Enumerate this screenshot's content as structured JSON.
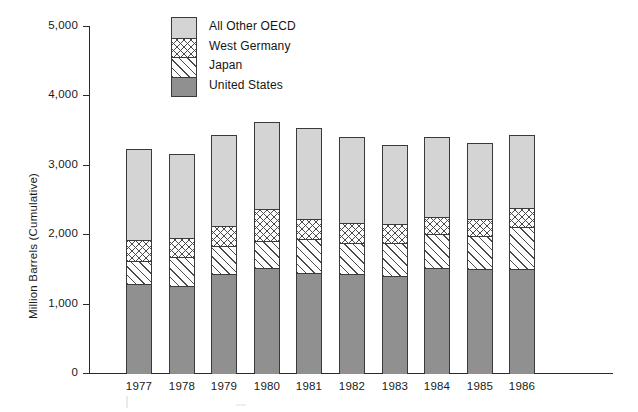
{
  "chart_data": {
    "type": "bar",
    "subtype": "stacked-bar",
    "title": "",
    "xlabel": "",
    "ylabel": "Million Barrels (Cumulative)",
    "categories": [
      "1977",
      "1978",
      "1979",
      "1980",
      "1981",
      "1982",
      "1983",
      "1984",
      "1985",
      "1986"
    ],
    "series": [
      {
        "name": "United States",
        "fill": "solid-gray",
        "values": [
          1297,
          1268,
          1441,
          1527,
          1455,
          1441,
          1412,
          1527,
          1513,
          1513
        ]
      },
      {
        "name": "Japan",
        "fill": "diagonal-hatch",
        "values": [
          332,
          418,
          403,
          389,
          490,
          447,
          476,
          490,
          475,
          605
        ]
      },
      {
        "name": "West Germany",
        "fill": "cross-hatch",
        "values": [
          302,
          273,
          289,
          462,
          289,
          288,
          273,
          245,
          246,
          274
        ]
      },
      {
        "name": "All Other OECD",
        "fill": "light-dotted",
        "values": [
          1297,
          1197,
          1297,
          1239,
          1296,
          1225,
          1124,
          1139,
          1080,
          1038
        ]
      }
    ],
    "cumulative_totals": [
      3228,
      3156,
      3430,
      3617,
      3530,
      3401,
      3285,
      3401,
      3314,
      3430
    ],
    "ylim": [
      0,
      5000
    ],
    "ytick_values": [
      0,
      1000,
      2000,
      3000,
      4000,
      5000
    ],
    "ytick_labels": [
      "0",
      "1,000",
      "2,000",
      "3,000",
      "4,000",
      "5,000"
    ],
    "grid": false,
    "legend_position": "top-center-inside",
    "legend_entries": [
      "All Other OECD",
      "West Germany",
      "Japan",
      "United States"
    ],
    "colors": {
      "all_other_oecd": "#d4d4d4",
      "west_germany": "#fdfdfd",
      "japan": "#fdfdfd",
      "united_states": "#909090",
      "axis": "#2b2b2b",
      "outline": "#3a3a3a",
      "text": "#1a1a1a",
      "background": "#ffffff"
    }
  }
}
